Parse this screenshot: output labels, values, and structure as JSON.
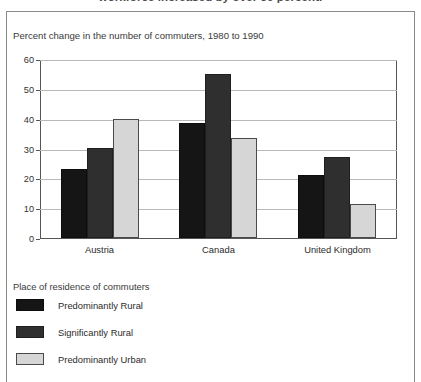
{
  "caption": {
    "cropped_line": "workforce increased by over 50 percent."
  },
  "chart_title": "Percent change in the number of commuters, 1980 to 1990",
  "legend": {
    "title": "Place of residence of commuters",
    "entries": [
      {
        "label": "Predominantly Rural",
        "color": "#151515"
      },
      {
        "label": "Significantly Rural",
        "color": "#2f2f2f"
      },
      {
        "label": "Predominantly Urban",
        "color": "#d6d6d6"
      }
    ]
  },
  "chart_data": {
    "type": "bar",
    "title": "Percent change in the number of commuters, 1980 to 1990",
    "xlabel": "",
    "ylabel": "",
    "ylim": [
      0,
      60
    ],
    "yticks": [
      0,
      10,
      20,
      30,
      40,
      50,
      60
    ],
    "grid": true,
    "legend_position": "below",
    "legend_title": "Place of residence of commuters",
    "categories": [
      "Austria",
      "Canada",
      "United Kingdom"
    ],
    "series": [
      {
        "name": "Predominantly Rural",
        "color": "#151515",
        "values": [
          23.5,
          39,
          21.5
        ]
      },
      {
        "name": "Significantly Rural",
        "color": "#2f2f2f",
        "values": [
          30.5,
          55.5,
          27.5
        ]
      },
      {
        "name": "Predominantly Urban",
        "color": "#d6d6d6",
        "values": [
          40.5,
          34,
          11.5
        ]
      }
    ]
  }
}
